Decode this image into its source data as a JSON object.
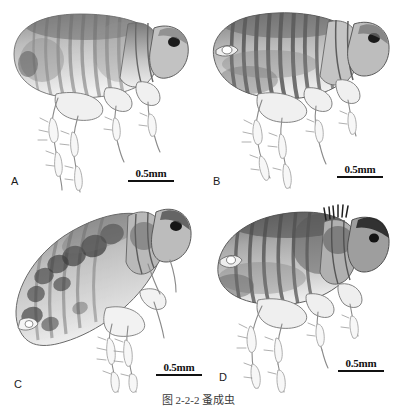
{
  "figure": {
    "caption": "图 2-2-2  蚤成虫",
    "background_color": "#ffffff",
    "ink_color": "#111111",
    "panel_count": 4
  },
  "panels": [
    {
      "id": "A",
      "label": "A",
      "scalebar_label": "0.5mm",
      "description": "lateral view of adult flea, pale abdomen with dark dorsal banding"
    },
    {
      "id": "B",
      "label": "B",
      "scalebar_label": "0.5mm",
      "description": "lateral view of adult flea, strongly striped abdominal terga"
    },
    {
      "id": "C",
      "label": "C",
      "scalebar_label": "0.5mm",
      "description": "lateral view of adult flea tilted, dark blotched abdomen"
    },
    {
      "id": "D",
      "label": "D",
      "scalebar_label": "0.5mm",
      "description": "lateral view of adult flea, dark head and banded abdomen"
    }
  ]
}
